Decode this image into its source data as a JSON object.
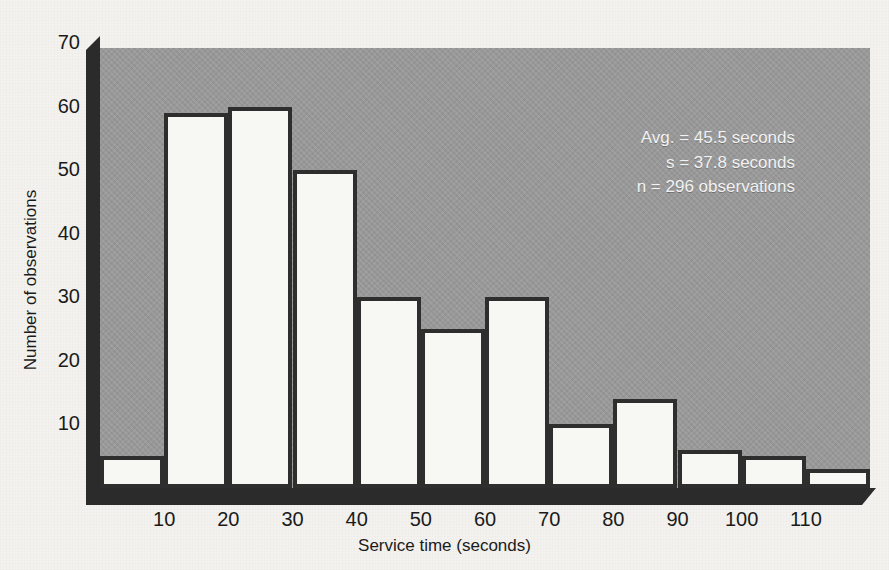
{
  "chart_data": {
    "type": "bar",
    "title": "",
    "subtitle": "",
    "xlabel": "Service time (seconds)",
    "ylabel": "Number of observations",
    "xlim": [
      0,
      120
    ],
    "ylim": [
      0,
      70
    ],
    "grid": false,
    "legend": null,
    "bin_width": 10,
    "bin_edges": [
      0,
      10,
      20,
      30,
      40,
      50,
      60,
      70,
      80,
      90,
      100,
      110,
      120
    ],
    "categories": [
      "0-10",
      "10-20",
      "20-30",
      "30-40",
      "40-50",
      "50-60",
      "60-70",
      "70-80",
      "80-90",
      "90-100",
      "100-110",
      "110-120"
    ],
    "values": [
      5,
      59,
      60,
      50,
      30,
      25,
      30,
      10,
      14,
      6,
      5,
      3
    ],
    "x_tick_labels": [
      "10",
      "20",
      "30",
      "40",
      "50",
      "60",
      "70",
      "80",
      "90",
      "100",
      "110"
    ],
    "x_tick_values": [
      10,
      20,
      30,
      40,
      50,
      60,
      70,
      80,
      90,
      100,
      110
    ],
    "y_tick_labels": [
      "10",
      "20",
      "30",
      "40",
      "50",
      "60",
      "70"
    ],
    "y_tick_values": [
      10,
      20,
      30,
      40,
      50,
      60,
      70
    ],
    "annotations": [
      "Avg. = 45.5 seconds",
      "s = 37.8 seconds",
      "n = 296 observations"
    ],
    "colors": {
      "plot_background": "#9a9a9a",
      "bar_fill": "#f7f7f4",
      "bar_outline": "#2e2e2e",
      "axis_slab": "#2b2b2b",
      "page_background": "#f3f2ef",
      "tick_text": "#1b1b1b",
      "annotation_text": "#f2f2f2"
    }
  },
  "stats": {
    "average_line": "Avg. = 45.5 seconds",
    "stdev_line": "s = 37.8 seconds",
    "count_line": "n = 296 observations"
  },
  "axes": {
    "x_title": "Service time (seconds)",
    "y_title": "Number of observations"
  }
}
